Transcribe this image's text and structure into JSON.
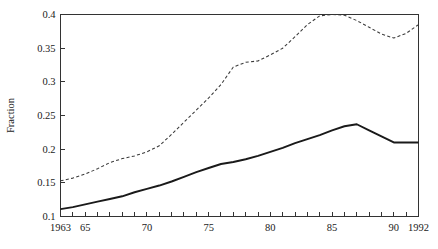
{
  "chart_data": {
    "type": "line",
    "title": "",
    "subtitle": "",
    "xlabel": "",
    "ylabel": "Fraction",
    "xlim": [
      1963,
      1992
    ],
    "ylim": [
      0.1,
      0.4
    ],
    "grid": false,
    "legend": "none",
    "x_tick_labels": [
      "1963",
      "65",
      "70",
      "75",
      "80",
      "85",
      "90",
      "1992"
    ],
    "x_tick_values": [
      1963,
      1965,
      1970,
      1975,
      1980,
      1985,
      1990,
      1992
    ],
    "x_minor_tick_values": [
      1963,
      1964,
      1965,
      1966,
      1967,
      1968,
      1969,
      1970,
      1971,
      1972,
      1973,
      1974,
      1975,
      1976,
      1977,
      1978,
      1979,
      1980,
      1981,
      1982,
      1983,
      1984,
      1985,
      1986,
      1987,
      1988,
      1989,
      1990,
      1991,
      1992
    ],
    "y_tick_labels": [
      "0.1",
      "0.15",
      "0.2",
      "0.25",
      "0.3",
      "0.35",
      "0.4"
    ],
    "y_tick_values": [
      0.1,
      0.15,
      0.2,
      0.25,
      0.3,
      0.35,
      0.4
    ],
    "x": [
      1963,
      1964,
      1965,
      1966,
      1967,
      1968,
      1969,
      1970,
      1971,
      1972,
      1973,
      1974,
      1975,
      1976,
      1977,
      1978,
      1979,
      1980,
      1981,
      1982,
      1983,
      1984,
      1985,
      1986,
      1987,
      1988,
      1989,
      1990,
      1991,
      1992
    ],
    "series": [
      {
        "name": "solid-series",
        "style": "solid",
        "color": "#1a1a1a",
        "values": [
          0.111,
          0.114,
          0.118,
          0.122,
          0.126,
          0.13,
          0.136,
          0.141,
          0.146,
          0.152,
          0.159,
          0.166,
          0.172,
          0.178,
          0.181,
          0.185,
          0.19,
          0.196,
          0.202,
          0.209,
          0.215,
          0.221,
          0.228,
          0.234,
          0.237,
          0.228,
          0.219,
          0.21,
          0.21,
          0.21
        ]
      },
      {
        "name": "dashed-series",
        "style": "dashed",
        "color": "#3a3a3a",
        "values": [
          0.153,
          0.157,
          0.163,
          0.171,
          0.18,
          0.186,
          0.19,
          0.196,
          0.205,
          0.222,
          0.24,
          0.258,
          0.276,
          0.296,
          0.322,
          0.329,
          0.331,
          0.34,
          0.35,
          0.367,
          0.385,
          0.398,
          0.4,
          0.399,
          0.391,
          0.381,
          0.371,
          0.365,
          0.372,
          0.385
        ]
      }
    ]
  },
  "axis": {
    "y_title": "Fraction"
  }
}
